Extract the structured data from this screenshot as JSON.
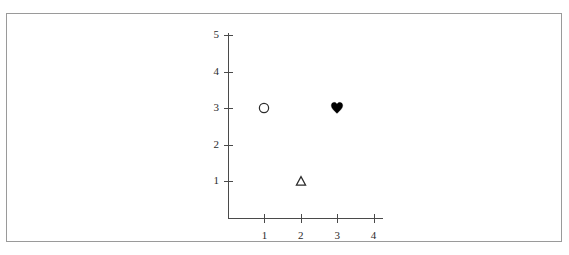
{
  "figure": {
    "background_color": "#ffffff",
    "frame_color": "#9a9a9a",
    "axis_color": "#4a4a4a",
    "label_color": "#2b2b2b"
  },
  "chart_data": {
    "type": "scatter",
    "title": "",
    "subtitle": "",
    "xlabel": "",
    "ylabel": "",
    "xlim": [
      0,
      4.35
    ],
    "ylim": [
      0,
      5
    ],
    "xticks": [
      "1",
      "2",
      "3",
      "4"
    ],
    "xtick_values": [
      1,
      2,
      3,
      4
    ],
    "yticks": [
      "1",
      "2",
      "3",
      "4",
      "5"
    ],
    "ytick_values": [
      1,
      2,
      3,
      4,
      5
    ],
    "grid": false,
    "legend": false,
    "legend_position": "none",
    "annotations": [],
    "points": [
      {
        "label": "open-circle-marker",
        "marker": "circle-open",
        "x": 1,
        "y": 3,
        "filled": false,
        "color": "#2b2b2b",
        "size": 11
      },
      {
        "label": "open-triangle-marker",
        "marker": "triangle-open",
        "x": 2,
        "y": 1,
        "filled": false,
        "color": "#2b2b2b",
        "size": 11
      },
      {
        "label": "filled-heart-marker",
        "marker": "heart-filled",
        "x": 3,
        "y": 3,
        "filled": true,
        "color": "#000000",
        "size": 12
      }
    ]
  },
  "axes_geometry": {
    "origin_x_px": 228,
    "origin_y_px": 218,
    "x_unit_px": 36.4,
    "y_unit_px": 36.6,
    "y_axis_top_px": 33,
    "x_axis_right_px": 383
  }
}
